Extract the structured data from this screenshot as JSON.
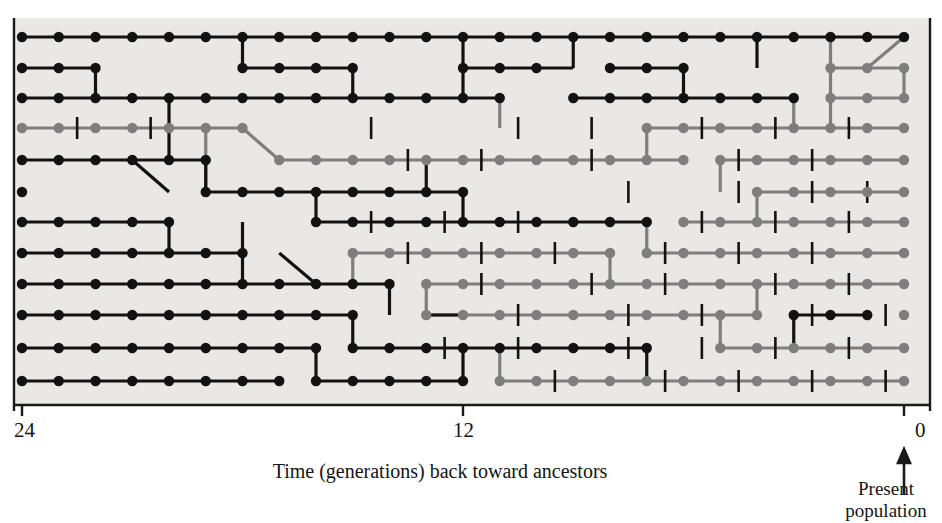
{
  "figure": {
    "type": "coalescent-genealogy",
    "axis": {
      "title": "Time (generations) back toward ancestors",
      "ticks": [
        {
          "value": 24,
          "label": "24",
          "x": 22
        },
        {
          "value": 12,
          "label": "12",
          "x": 463
        },
        {
          "value": 0,
          "label": "0",
          "x": 904
        }
      ],
      "range": [
        24,
        0
      ],
      "direction": "right-to-left",
      "present_label_line1": "Present",
      "present_label_line2": "population"
    },
    "colors": {
      "background": "#e9e8e5",
      "ancestral_line": "#121212",
      "extinct_line": "#7e7e7e",
      "mutation_tick": "#121212",
      "axis": "#1a1a1a"
    },
    "legend_semantics": {
      "black": "lineage ancestral to the present population",
      "gray": "lineage that leaves no present-day descendants",
      "vertical_tick": "mutation event"
    },
    "geometry": {
      "plot_left": 14,
      "plot_right": 930,
      "plot_top": 18,
      "plot_bottom": 405,
      "col_x0": 22,
      "col_step": 36.75,
      "n_generations": 24,
      "row_y0": 37,
      "row_step": 30.8,
      "n_rows": 13,
      "dot_radius": 5.2,
      "line_width": 3.2
    },
    "rows": [
      {
        "id": 1,
        "y": 37,
        "segments": [
          {
            "color": "black",
            "from": 0,
            "to": 24
          }
        ]
      },
      {
        "id": 2,
        "y": 68,
        "segments": [
          {
            "color": "black",
            "from": 0,
            "to": 2
          },
          {
            "color": "black",
            "from": 6,
            "to": 9
          },
          {
            "color": "black",
            "from": 12,
            "to": 14
          },
          {
            "color": "black",
            "from": 16,
            "to": 18
          },
          {
            "color": "gray",
            "from": 22,
            "to": 24
          }
        ]
      },
      {
        "id": 3,
        "y": 98,
        "segments": [
          {
            "color": "black",
            "from": 0,
            "to": 13
          },
          {
            "color": "black",
            "from": 15,
            "to": 21
          },
          {
            "color": "gray",
            "from": 22,
            "to": 24
          }
        ]
      },
      {
        "id": 4,
        "y": 128,
        "segments": [
          {
            "color": "gray",
            "from": 0,
            "to": 6
          },
          {
            "color": "gray",
            "from": 17,
            "to": 24
          }
        ]
      },
      {
        "id": 5,
        "y": 160,
        "segments": [
          {
            "color": "black",
            "from": 0,
            "to": 5
          },
          {
            "color": "gray",
            "from": 7,
            "to": 18
          },
          {
            "color": "gray",
            "from": 19,
            "to": 24
          }
        ]
      },
      {
        "id": 6,
        "y": 192,
        "segments": [
          {
            "color": "black",
            "from": 0,
            "to": 0
          },
          {
            "color": "black",
            "from": 5,
            "to": 12
          },
          {
            "color": "gray",
            "from": 20,
            "to": 24
          }
        ]
      },
      {
        "id": 7,
        "y": 222,
        "segments": [
          {
            "color": "black",
            "from": 0,
            "to": 4
          },
          {
            "color": "black",
            "from": 8,
            "to": 17
          },
          {
            "color": "gray",
            "from": 18,
            "to": 24
          }
        ]
      },
      {
        "id": 8,
        "y": 253,
        "segments": [
          {
            "color": "black",
            "from": 0,
            "to": 6
          },
          {
            "color": "gray",
            "from": 9,
            "to": 16
          },
          {
            "color": "gray",
            "from": 17,
            "to": 24
          }
        ]
      },
      {
        "id": 9,
        "y": 284,
        "segments": [
          {
            "color": "black",
            "from": 0,
            "to": 10
          },
          {
            "color": "gray",
            "from": 11,
            "to": 24
          }
        ]
      },
      {
        "id": 10,
        "y": 315,
        "segments": [
          {
            "color": "black",
            "from": 0,
            "to": 9
          },
          {
            "color": "gray",
            "from": 11,
            "to": 20
          },
          {
            "color": "black",
            "from": 21,
            "to": 23
          },
          {
            "color": "gray",
            "from": 24,
            "to": 24
          }
        ]
      },
      {
        "id": 11,
        "y": 348,
        "segments": [
          {
            "color": "black",
            "from": 0,
            "to": 8
          },
          {
            "color": "black",
            "from": 9,
            "to": 17
          },
          {
            "color": "gray",
            "from": 19,
            "to": 24
          }
        ]
      },
      {
        "id": 12,
        "y": 381,
        "segments": [
          {
            "color": "black",
            "from": 0,
            "to": 7
          },
          {
            "color": "black",
            "from": 8,
            "to": 12
          },
          {
            "color": "gray",
            "from": 13,
            "to": 24
          }
        ]
      }
    ],
    "mutation_ticks": [
      {
        "row": 4,
        "gen": [
          1.5,
          3.5,
          9.5,
          13.5,
          15.5,
          18.5,
          20.5,
          22.5
        ]
      },
      {
        "row": 5,
        "gen": [
          10.5,
          12.5,
          15.5,
          19.5,
          21.5
        ]
      },
      {
        "row": 6,
        "gen": [
          16.5,
          19.5,
          21.5,
          23.0
        ]
      },
      {
        "row": 7,
        "gen": [
          9.5,
          11.5,
          13.5,
          18.5,
          20.5,
          22.5
        ]
      },
      {
        "row": 8,
        "gen": [
          10.5,
          12.5,
          14.5,
          17.5,
          19.5,
          21.5
        ]
      },
      {
        "row": 9,
        "gen": [
          12.5,
          15.5,
          17.5,
          20.5,
          22.5
        ]
      },
      {
        "row": 10,
        "gen": [
          13.5,
          16.5,
          18.5,
          21.5,
          23.5
        ]
      },
      {
        "row": 11,
        "gen": [
          11.5,
          13.5,
          16.5,
          18.5,
          20.5,
          22.5
        ]
      },
      {
        "row": 12,
        "gen": [
          14.5,
          17.5,
          19.5,
          21.5,
          23.5
        ]
      }
    ]
  }
}
